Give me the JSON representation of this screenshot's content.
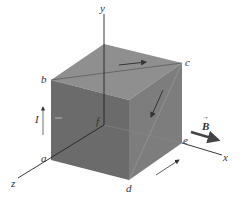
{
  "figure": {
    "axes": {
      "x": "x",
      "y": "y",
      "z": "z"
    },
    "vertices": {
      "a": "a",
      "b": "b",
      "c": "c",
      "d": "d",
      "e": "e",
      "f": "f"
    },
    "current_label": "I",
    "field_label": "B",
    "field_arrow": "→",
    "colors": {
      "top_face": "#8f8f8f",
      "front_face": "#6b6b6b",
      "right_face": "#7d7d7d",
      "edges": "#2a2a2a",
      "axes": "#222222",
      "background": "#ffffff"
    }
  }
}
